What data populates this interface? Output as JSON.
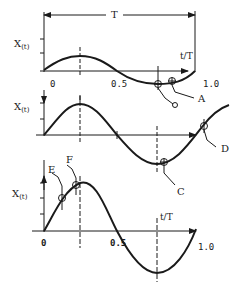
{
  "figure": {
    "period_label": "T",
    "ylabel_main": "X",
    "ylabel_sub": "(t)",
    "xlabel": "t/T",
    "panels": [
      {
        "id": "top",
        "ticks": {
          "start": "0",
          "mid": "0.5",
          "end": "1.0"
        },
        "markers": [
          {
            "label": "O",
            "description": "point at trough of small-amplitude wave"
          },
          {
            "label": "A",
            "description": "point just past trough"
          }
        ]
      },
      {
        "id": "middle",
        "markers": [
          {
            "label": "C",
            "description": "point just after trough"
          },
          {
            "label": "D",
            "description": "point on rising segment after zero crossing"
          }
        ]
      },
      {
        "id": "bottom",
        "ticks": {
          "start": "0",
          "mid": "0.5",
          "end": "1.0"
        },
        "markers": [
          {
            "label": "E",
            "description": "point on rising segment before crest"
          },
          {
            "label": "F",
            "description": "point near crest"
          }
        ]
      }
    ]
  },
  "colors": {
    "ink": "#1a1a1a",
    "background": "#ffffff"
  }
}
